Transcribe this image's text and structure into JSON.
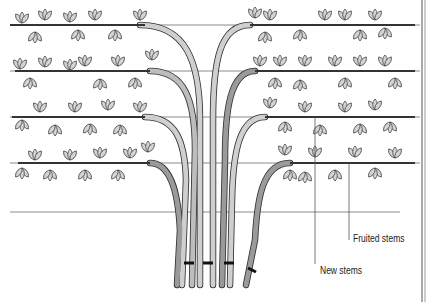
{
  "figure": {
    "labels": {
      "fruited_stems": "Fruited stems",
      "new_stems": "New stems"
    },
    "wires_y": [
      25,
      71,
      117,
      163,
      212
    ],
    "colors": {
      "wire": "#8a8a8a",
      "stem_fill": "#c8c8c8",
      "stem_dark": "#9a9a9a",
      "leaf_fill": "#d4d4d4",
      "outline": "#333333",
      "tie": "#111111"
    }
  }
}
